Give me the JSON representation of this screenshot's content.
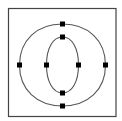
{
  "diagram": {
    "title": "",
    "frame": {
      "x": 8.5,
      "y": 8.5,
      "w": 107.5,
      "h": 108,
      "stroke": "#444444"
    },
    "outer_contour": {
      "cx": 62.5,
      "cy": 65,
      "rx": 43,
      "ry": 41,
      "points": [
        [
          62.5,
          24
        ],
        [
          105.5,
          65
        ],
        [
          62.5,
          106
        ],
        [
          19.5,
          65
        ]
      ]
    },
    "inner_contour": {
      "cx": 62.5,
      "cy": 65,
      "rx": 16,
      "ry": 28,
      "points": [
        [
          62.5,
          37
        ],
        [
          78.5,
          65
        ],
        [
          62.5,
          93
        ],
        [
          46.5,
          65
        ]
      ]
    },
    "stroke_color": "#555555",
    "point_color": "#000000"
  }
}
